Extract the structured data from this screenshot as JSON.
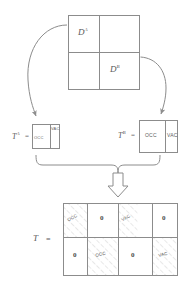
{
  "figure": {
    "type": "block-matrix-decomposition-diagram"
  },
  "top_matrix": {
    "name": "domain-matrix",
    "rows": 2,
    "cols": 2,
    "cells": [
      {
        "label": "D",
        "superscript": "A",
        "row": 0,
        "col": 0
      },
      {
        "label": "",
        "superscript": "",
        "row": 0,
        "col": 1
      },
      {
        "label": "",
        "superscript": "",
        "row": 1,
        "col": 0
      },
      {
        "label": "D",
        "superscript": "B",
        "row": 1,
        "col": 1
      }
    ]
  },
  "left_matrix": {
    "name": "transfer-matrix-a",
    "label": "T",
    "superscript": "A",
    "equals": "=",
    "cells": [
      {
        "text": "OCC"
      },
      {
        "text": "VAC"
      }
    ]
  },
  "right_matrix": {
    "name": "transfer-matrix-b",
    "label": "T",
    "superscript": "B",
    "equals": "=",
    "cells": [
      {
        "text": "OCC"
      },
      {
        "text": "VAC"
      }
    ]
  },
  "bottom_matrix": {
    "name": "assembled-matrix",
    "label": "T",
    "equals": "=",
    "rows": 2,
    "cols": 4,
    "cells": [
      {
        "text": "OCC",
        "kind": "hatched",
        "row": 0,
        "col": 0
      },
      {
        "text": "0",
        "kind": "zero",
        "row": 0,
        "col": 1
      },
      {
        "text": "VAC",
        "kind": "hatched",
        "row": 0,
        "col": 2
      },
      {
        "text": "0",
        "kind": "zero",
        "row": 0,
        "col": 3
      },
      {
        "text": "0",
        "kind": "zero",
        "row": 1,
        "col": 0
      },
      {
        "text": "OCC",
        "kind": "hatched",
        "row": 1,
        "col": 1
      },
      {
        "text": "0",
        "kind": "zero",
        "row": 1,
        "col": 2
      },
      {
        "text": "VAC",
        "kind": "hatched",
        "row": 1,
        "col": 3
      }
    ]
  },
  "connectors": {
    "arrow_left": "curved-arrow-from-DA-to-TA",
    "arrow_right": "curved-arrow-from-DB-to-TB",
    "brace": "curly-brace-joining-TA-TB",
    "block_arrow": "hollow-down-arrow-to-T"
  },
  "colors": {
    "stroke": "#8c8c8c",
    "text": "#5a5a5a",
    "hatch": "#b3b3b3",
    "background": "#ffffff"
  }
}
